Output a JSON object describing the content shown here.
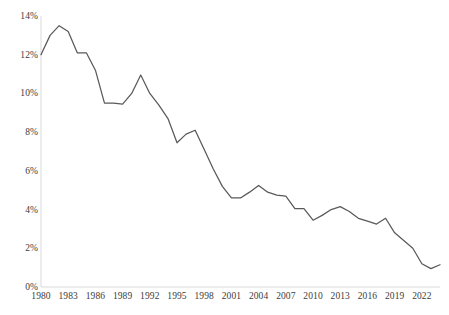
{
  "chart_data": {
    "type": "line",
    "title": "",
    "subtitle": "",
    "xlabel": "",
    "ylabel": "",
    "grid": false,
    "legend": null,
    "legend_position": "none",
    "line_color": "#595959",
    "axis_color": "#d9d9d9",
    "tick_text_color": "#3c3c3c",
    "xlim": [
      1980,
      2024
    ],
    "ylim": [
      0,
      14
    ],
    "y_ticks": [
      0,
      2,
      4,
      6,
      8,
      10,
      12,
      14
    ],
    "y_tick_labels": [
      "0%",
      "2%",
      "4%",
      "6%",
      "8%",
      "10%",
      "12%",
      "14%"
    ],
    "x_ticks": [
      1980,
      1983,
      1986,
      1989,
      1992,
      1995,
      1998,
      2001,
      2004,
      2007,
      2010,
      2013,
      2016,
      2019,
      2022
    ],
    "x_tick_labels": [
      "1980",
      "1983",
      "1986",
      "1989",
      "1992",
      "1995",
      "1998",
      "2001",
      "2004",
      "2007",
      "2010",
      "2013",
      "2016",
      "2019",
      "2022"
    ],
    "x": [
      1980,
      1981,
      1982,
      1983,
      1984,
      1985,
      1986,
      1987,
      1988,
      1989,
      1990,
      1991,
      1992,
      1993,
      1994,
      1995,
      1996,
      1997,
      1998,
      1999,
      2000,
      2001,
      2002,
      2003,
      2004,
      2005,
      2006,
      2007,
      2008,
      2009,
      2010,
      2011,
      2012,
      2013,
      2014,
      2015,
      2016,
      2017,
      2018,
      2019,
      2020,
      2021,
      2022,
      2023,
      2024
    ],
    "values": [
      12.0,
      13.0,
      13.5,
      13.2,
      12.1,
      12.1,
      11.2,
      9.5,
      9.5,
      9.45,
      10.0,
      10.95,
      10.0,
      9.4,
      8.7,
      7.45,
      7.9,
      8.1,
      7.1,
      6.1,
      5.2,
      4.6,
      4.6,
      4.9,
      5.25,
      4.9,
      4.75,
      4.7,
      4.05,
      4.05,
      3.45,
      3.7,
      4.0,
      4.15,
      3.9,
      3.55,
      3.4,
      3.25,
      3.55,
      2.8,
      2.4,
      2.0,
      1.2,
      0.95,
      1.15
    ],
    "series": [
      {
        "name": "rate",
        "points": [
          {
            "x": 1980,
            "y": 12.0
          },
          {
            "x": 1981,
            "y": 13.0
          },
          {
            "x": 1982,
            "y": 13.5
          },
          {
            "x": 1983,
            "y": 13.2
          },
          {
            "x": 1984,
            "y": 12.1
          },
          {
            "x": 1985,
            "y": 12.1
          },
          {
            "x": 1986,
            "y": 11.2
          },
          {
            "x": 1987,
            "y": 9.5
          },
          {
            "x": 1988,
            "y": 9.5
          },
          {
            "x": 1989,
            "y": 9.45
          },
          {
            "x": 1990,
            "y": 10.0
          },
          {
            "x": 1991,
            "y": 10.95
          },
          {
            "x": 1992,
            "y": 10.0
          },
          {
            "x": 1993,
            "y": 9.4
          },
          {
            "x": 1994,
            "y": 8.7
          },
          {
            "x": 1995,
            "y": 7.45
          },
          {
            "x": 1996,
            "y": 7.9
          },
          {
            "x": 1997,
            "y": 8.1
          },
          {
            "x": 1998,
            "y": 7.1
          },
          {
            "x": 1999,
            "y": 6.1
          },
          {
            "x": 2000,
            "y": 5.2
          },
          {
            "x": 2001,
            "y": 4.6
          },
          {
            "x": 2002,
            "y": 4.6
          },
          {
            "x": 2003,
            "y": 4.9
          },
          {
            "x": 2004,
            "y": 5.25
          },
          {
            "x": 2005,
            "y": 4.9
          },
          {
            "x": 2006,
            "y": 4.75
          },
          {
            "x": 2007,
            "y": 4.7
          },
          {
            "x": 2008,
            "y": 4.05
          },
          {
            "x": 2009,
            "y": 4.05
          },
          {
            "x": 2010,
            "y": 3.45
          },
          {
            "x": 2011,
            "y": 3.7
          },
          {
            "x": 2012,
            "y": 4.0
          },
          {
            "x": 2013,
            "y": 4.15
          },
          {
            "x": 2014,
            "y": 3.9
          },
          {
            "x": 2015,
            "y": 3.55
          },
          {
            "x": 2016,
            "y": 3.4
          },
          {
            "x": 2017,
            "y": 3.25
          },
          {
            "x": 2018,
            "y": 3.55
          },
          {
            "x": 2019,
            "y": 2.8
          },
          {
            "x": 2020,
            "y": 2.4
          },
          {
            "x": 2021,
            "y": 2.0
          },
          {
            "x": 2022,
            "y": 1.2
          },
          {
            "x": 2023,
            "y": 0.95
          },
          {
            "x": 2024,
            "y": 1.15
          }
        ]
      }
    ]
  },
  "plot_geometry": {
    "left": 41,
    "right": 440,
    "top": 16,
    "bottom": 287
  }
}
